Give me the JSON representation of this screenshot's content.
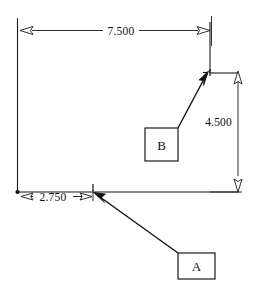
{
  "drawing": {
    "title": "Dimensioned rectangle sketch",
    "background_color": "#ffffff",
    "line_color": "#1a1a1a",
    "width": 266,
    "height": 292
  },
  "dimensions": [
    {
      "id": "width-overall",
      "label": "7.500",
      "orientation": "horizontal",
      "position": "top",
      "arrow_style": "outward",
      "value": 7.5
    },
    {
      "id": "height-right",
      "label": "4.500",
      "orientation": "vertical",
      "position": "right",
      "arrow_style": "inward",
      "value": 4.5
    },
    {
      "id": "offset-bottom-left",
      "label": "2.750",
      "orientation": "horizontal",
      "position": "bottom-left",
      "arrow_style": "inward",
      "value": 2.75
    }
  ],
  "callouts": [
    {
      "id": "callout-a",
      "label": "A",
      "shape": "rectangle",
      "points_to": "bottom-edge-node"
    },
    {
      "id": "callout-b",
      "label": "B",
      "shape": "square",
      "points_to": "top-right-node"
    }
  ]
}
